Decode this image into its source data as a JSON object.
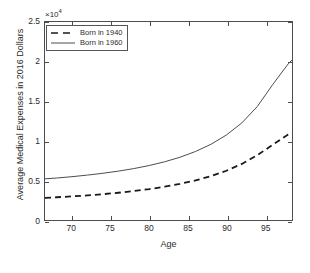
{
  "chart_data": {
    "type": "line",
    "title": "",
    "xlabel": "Age",
    "ylabel": "Average Medical Expenses in 2016 Dollars",
    "exponent_label": "×10",
    "exponent_power": "4",
    "y_scale_factor": 10000,
    "xlim": [
      66.5,
      98.5
    ],
    "ylim": [
      0,
      25000
    ],
    "xticks": [
      70,
      75,
      80,
      85,
      90,
      95
    ],
    "xtick_labels": [
      "70",
      "75",
      "80",
      "85",
      "90",
      "95"
    ],
    "yticks": [
      0,
      5000,
      10000,
      15000,
      20000,
      25000
    ],
    "ytick_labels": [
      "0",
      "0.5",
      "1",
      "1.5",
      "2",
      "2.5"
    ],
    "grid": false,
    "legend_position": "top-left",
    "x": [
      66.5,
      68,
      70,
      72,
      74,
      76,
      78,
      80,
      82,
      84,
      86,
      88,
      90,
      92,
      94,
      96,
      98,
      98.5
    ],
    "series": [
      {
        "name": "Born in 1940",
        "style": "dashed",
        "color": "#1a1a1a",
        "values": [
          2800,
          2870,
          2980,
          3110,
          3260,
          3440,
          3650,
          3900,
          4200,
          4560,
          5000,
          5540,
          6220,
          7080,
          8180,
          9500,
          10800,
          11000
        ]
      },
      {
        "name": "Born in 1960",
        "style": "solid",
        "color": "#4d4d4d",
        "values": [
          5200,
          5300,
          5470,
          5670,
          5900,
          6170,
          6490,
          6880,
          7350,
          7930,
          8650,
          9560,
          10730,
          12260,
          14320,
          17100,
          19700,
          20200
        ]
      }
    ]
  },
  "legend": {
    "entries": [
      {
        "label": "Born in 1940"
      },
      {
        "label": "Born in 1960"
      }
    ]
  },
  "axis": {
    "x_title": "Age",
    "y_title": "Average Medical Expenses in 2016 Dollars"
  },
  "colors": {
    "axis": "#4d4d4d",
    "text": "#2b2b2b",
    "series_1940": "#1a1a1a",
    "series_1960": "#4d4d4d",
    "background": "#ffffff"
  }
}
